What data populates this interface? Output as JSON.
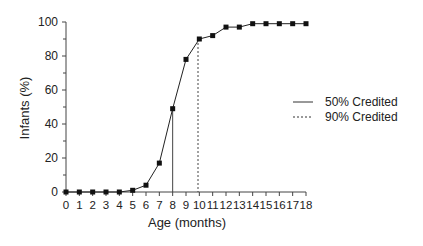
{
  "chart_data": {
    "type": "line",
    "title": "",
    "xlabel": "Age (months)",
    "ylabel": "Infants (%)",
    "xlim": [
      0,
      18
    ],
    "ylim": [
      0,
      100
    ],
    "x_ticks": [
      0,
      1,
      2,
      3,
      4,
      5,
      6,
      7,
      8,
      9,
      10,
      11,
      12,
      13,
      14,
      15,
      16,
      17,
      18
    ],
    "y_ticks": [
      0,
      20,
      40,
      60,
      80,
      100
    ],
    "y_minor_ticks": [
      10,
      30,
      50,
      70,
      90
    ],
    "grid": false,
    "x": [
      0,
      1,
      2,
      3,
      4,
      5,
      6,
      7,
      8,
      9,
      10,
      11,
      12,
      13,
      14,
      15,
      16,
      17,
      18
    ],
    "series": [
      {
        "name": "Infants crediting",
        "marker": "square",
        "values": [
          0,
          0,
          0,
          0,
          0,
          1,
          4,
          17,
          49,
          78,
          90,
          92,
          97,
          97,
          99,
          99,
          99,
          99,
          99
        ]
      }
    ],
    "reference_lines": [
      {
        "label": "50% Credited",
        "style": "solid",
        "x": 8.0,
        "y_to": 49
      },
      {
        "label": "90% Credited",
        "style": "dashed",
        "x": 9.9,
        "y_to": 90
      }
    ],
    "legend": {
      "position": "right",
      "entries": [
        {
          "label": "50% Credited",
          "style": "solid"
        },
        {
          "label": "90% Credited",
          "style": "dashed"
        }
      ]
    }
  }
}
